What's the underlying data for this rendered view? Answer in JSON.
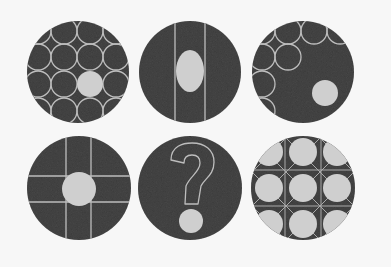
{
  "puzzle": {
    "title": "Pattern sequence puzzle",
    "background": "#f7f7f7",
    "disc_color": "#4a4a4a",
    "line_color": "#bdbdbd",
    "fill_color": "#cfcfcf",
    "question_mark": "?",
    "tiles": [
      {
        "id": 1,
        "row": 1,
        "col": 1,
        "description": "disc tiled with outlined circles, one filled circle lower-right of center"
      },
      {
        "id": 2,
        "row": 1,
        "col": 2,
        "description": "disc with two vertical lines and a filled vertical oval between them"
      },
      {
        "id": 3,
        "row": 1,
        "col": 3,
        "description": "disc with outlined circles in upper-left region and a filled circle at lower right"
      },
      {
        "id": 4,
        "row": 2,
        "col": 1,
        "description": "disc with two vertical and two horizontal lines forming a grid and a filled circle at the center"
      },
      {
        "id": 5,
        "row": 2,
        "col": 2,
        "description": "disc with outlined question mark and filled circle dot"
      },
      {
        "id": 6,
        "row": 2,
        "col": 3,
        "description": "disc filled with light circles on a criss-cross lattice"
      }
    ]
  }
}
